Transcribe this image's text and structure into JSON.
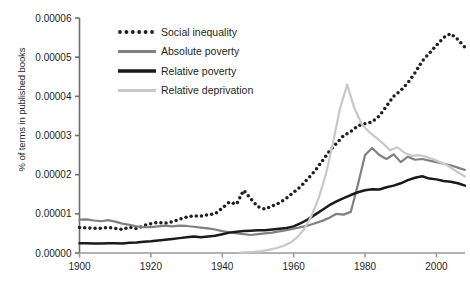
{
  "chart_data": {
    "type": "line",
    "title": "",
    "xlabel": "",
    "ylabel": "% of terms in published books",
    "xlim": [
      1900,
      2008
    ],
    "ylim": [
      0.0,
      6e-05
    ],
    "xticks": [
      1900,
      1920,
      1940,
      1960,
      1980,
      2000
    ],
    "xtick_labels": [
      "1900",
      "1920",
      "1940",
      "1960",
      "1980",
      "2000"
    ],
    "yticks": [
      0.0,
      1e-05,
      2e-05,
      3e-05,
      4e-05,
      5e-05,
      6e-05
    ],
    "ytick_labels": [
      "0.00000",
      "0.00001",
      "0.00002",
      "0.00003",
      "0.00004",
      "0.00005",
      "0.00006"
    ],
    "grid": false,
    "legend_position": "upper-left-inside",
    "series": [
      {
        "name": "Social inequality",
        "color": "#231f20",
        "style": "dotted",
        "x": [
          1900,
          1902,
          1904,
          1906,
          1908,
          1910,
          1912,
          1914,
          1916,
          1918,
          1920,
          1922,
          1924,
          1926,
          1928,
          1930,
          1932,
          1934,
          1936,
          1938,
          1940,
          1942,
          1944,
          1946,
          1948,
          1950,
          1952,
          1954,
          1956,
          1958,
          1960,
          1962,
          1964,
          1966,
          1968,
          1970,
          1972,
          1974,
          1976,
          1978,
          1980,
          1982,
          1984,
          1986,
          1988,
          1990,
          1992,
          1994,
          1996,
          1998,
          2000,
          2002,
          2004,
          2006,
          2008
        ],
        "y": [
          6.5e-06,
          6.4e-06,
          6.3e-06,
          6.3e-06,
          6.5e-06,
          6.3e-06,
          6e-06,
          6.6e-06,
          6.2e-06,
          7e-06,
          7.5e-06,
          7.8e-06,
          7.6e-06,
          8e-06,
          8.6e-06,
          9.2e-06,
          9.5e-06,
          9.4e-06,
          9.8e-06,
          1e-05,
          1.15e-05,
          1.3e-05,
          1.25e-05,
          1.6e-05,
          1.38e-05,
          1.18e-05,
          1.12e-05,
          1.2e-05,
          1.28e-05,
          1.4e-05,
          1.55e-05,
          1.7e-05,
          1.9e-05,
          2.1e-05,
          2.35e-05,
          2.6e-05,
          2.8e-05,
          3e-05,
          3.1e-05,
          3.25e-05,
          3.3e-05,
          3.35e-05,
          3.5e-05,
          3.75e-05,
          4e-05,
          4.15e-05,
          4.35e-05,
          4.6e-05,
          4.9e-05,
          5.1e-05,
          5.3e-05,
          5.5e-05,
          5.6e-05,
          5.45e-05,
          5.25e-05
        ]
      },
      {
        "name": "Absolute poverty",
        "color": "#808080",
        "style": "solid",
        "x": [
          1900,
          1902,
          1904,
          1906,
          1908,
          1910,
          1912,
          1914,
          1916,
          1918,
          1920,
          1922,
          1924,
          1926,
          1928,
          1930,
          1932,
          1934,
          1936,
          1938,
          1940,
          1942,
          1944,
          1946,
          1948,
          1950,
          1952,
          1954,
          1956,
          1958,
          1960,
          1962,
          1964,
          1966,
          1968,
          1970,
          1972,
          1974,
          1976,
          1978,
          1980,
          1982,
          1984,
          1986,
          1988,
          1990,
          1992,
          1994,
          1996,
          1998,
          2000,
          2002,
          2004,
          2006,
          2008
        ],
        "y": [
          8.5e-06,
          8.6e-06,
          8.3e-06,
          8.1e-06,
          8.4e-06,
          8e-06,
          7.5e-06,
          7.2e-06,
          6.8e-06,
          6.6e-06,
          6.6e-06,
          6.8e-06,
          7e-06,
          6.8e-06,
          7e-06,
          6.9e-06,
          6.7e-06,
          6.5e-06,
          6.3e-06,
          6e-06,
          5.6e-06,
          5.3e-06,
          5e-06,
          4.8e-06,
          4.6e-06,
          4.8e-06,
          5e-06,
          5.2e-06,
          5.5e-06,
          5.8e-06,
          6.2e-06,
          6.6e-06,
          7e-06,
          7.6e-06,
          8.2e-06,
          9e-06,
          1e-05,
          9.8e-06,
          1.05e-05,
          1.75e-05,
          2.5e-05,
          2.68e-05,
          2.5e-05,
          2.4e-05,
          2.52e-05,
          2.32e-05,
          2.46e-05,
          2.38e-05,
          2.4e-05,
          2.36e-05,
          2.32e-05,
          2.28e-05,
          2.24e-05,
          2.18e-05,
          2.12e-05
        ]
      },
      {
        "name": "Relative poverty",
        "color": "#1a1a1a",
        "style": "solid",
        "x": [
          1900,
          1902,
          1904,
          1906,
          1908,
          1910,
          1912,
          1914,
          1916,
          1918,
          1920,
          1922,
          1924,
          1926,
          1928,
          1930,
          1932,
          1934,
          1936,
          1938,
          1940,
          1942,
          1944,
          1946,
          1948,
          1950,
          1952,
          1954,
          1956,
          1958,
          1960,
          1962,
          1964,
          1966,
          1968,
          1970,
          1972,
          1974,
          1976,
          1978,
          1980,
          1982,
          1984,
          1986,
          1988,
          1990,
          1992,
          1994,
          1996,
          1998,
          2000,
          2002,
          2004,
          2006,
          2008
        ],
        "y": [
          2.5e-06,
          2.5e-06,
          2.4e-06,
          2.4e-06,
          2.5e-06,
          2.5e-06,
          2.4e-06,
          2.6e-06,
          2.7e-06,
          2.9e-06,
          3e-06,
          3.2e-06,
          3.4e-06,
          3.6e-06,
          3.8e-06,
          4e-06,
          4.2e-06,
          4e-06,
          4.2e-06,
          4.4e-06,
          4.8e-06,
          5.2e-06,
          5.4e-06,
          5.6e-06,
          5.7e-06,
          5.8e-06,
          5.8e-06,
          6e-06,
          6.2e-06,
          6.4e-06,
          6.8e-06,
          7.6e-06,
          8.6e-06,
          9.8e-06,
          1.1e-05,
          1.22e-05,
          1.32e-05,
          1.4e-05,
          1.48e-05,
          1.55e-05,
          1.6e-05,
          1.63e-05,
          1.62e-05,
          1.68e-05,
          1.72e-05,
          1.78e-05,
          1.86e-05,
          1.92e-05,
          1.96e-05,
          1.9e-05,
          1.88e-05,
          1.84e-05,
          1.82e-05,
          1.78e-05,
          1.72e-05
        ]
      },
      {
        "name": "Relative deprivation",
        "color": "#c8c8c8",
        "style": "solid",
        "x": [
          1945,
          1947,
          1949,
          1951,
          1953,
          1955,
          1957,
          1959,
          1961,
          1963,
          1965,
          1967,
          1969,
          1971,
          1973,
          1975,
          1977,
          1979,
          1981,
          1983,
          1985,
          1987,
          1989,
          1991,
          1993,
          1995,
          1997,
          1999,
          2001,
          2003,
          2005,
          2008
        ],
        "y": [
          1e-07,
          2e-07,
          3e-07,
          5e-07,
          8e-07,
          1.2e-06,
          1.8e-06,
          2.6e-06,
          4e-06,
          6.2e-06,
          9.5e-06,
          1.4e-05,
          2e-05,
          2.8e-05,
          3.7e-05,
          4.3e-05,
          3.7e-05,
          3.3e-05,
          3.1e-05,
          2.95e-05,
          2.8e-05,
          2.62e-05,
          2.7e-05,
          2.56e-05,
          2.48e-05,
          2.5e-05,
          2.46e-05,
          2.4e-05,
          2.32e-05,
          2.24e-05,
          2.12e-05,
          1.95e-05
        ]
      }
    ]
  }
}
